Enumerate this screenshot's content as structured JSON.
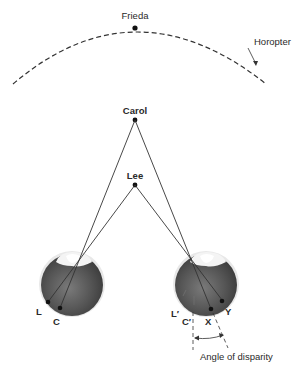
{
  "diagram": {
    "points": {
      "frieda": {
        "label": "Frieda",
        "x": 135,
        "y": 28
      },
      "carol": {
        "label": "Carol",
        "x": 135,
        "y": 120
      },
      "lee": {
        "label": "Lee",
        "x": 135,
        "y": 185
      }
    },
    "horopter_label": "Horopter",
    "left_eye": {
      "labels": {
        "l": "L",
        "c": "C"
      }
    },
    "right_eye": {
      "labels": {
        "l": "L′",
        "c": "C′",
        "x": "X",
        "y": "Y"
      }
    },
    "angle_label": "Angle of disparity",
    "colors": {
      "line": "#333333",
      "eye_dark": "#4a4a4a",
      "eye_light": "#9a9a9a",
      "text": "#2a2a2a"
    }
  }
}
